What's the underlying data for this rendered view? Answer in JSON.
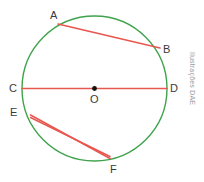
{
  "figure": {
    "width": 204,
    "height": 182,
    "background_color": "#ffffff",
    "credit_text": "Ilustrações DAE",
    "credit_color": "#9a9a9a"
  },
  "colors": {
    "circle_stroke": "#3FA34D",
    "chord_stroke": "#E8574F",
    "center_dot": "#111111",
    "label_text": "#3a3a3a"
  },
  "chart_data": {
    "type": "diagram",
    "circle": {
      "center": {
        "x": 94.5,
        "y": 88.5
      },
      "radius": 72.5,
      "stroke": "#3FA34D",
      "stroke_width": 1.4
    },
    "center_point": {
      "id": "O",
      "x": 94.5,
      "y": 88.5,
      "dot_radius": 2.4
    },
    "points": [
      {
        "id": "A",
        "x": 58.0,
        "y": 24.0,
        "label_x": 50,
        "label_y": 10
      },
      {
        "id": "B",
        "x": 160.0,
        "y": 48.0,
        "label_x": 163,
        "label_y": 44
      },
      {
        "id": "C",
        "x": 22.0,
        "y": 88.5,
        "label_x": 9,
        "label_y": 83
      },
      {
        "id": "D",
        "x": 167.0,
        "y": 88.5,
        "label_x": 170,
        "label_y": 83
      },
      {
        "id": "E",
        "x": 30.5,
        "y": 115.0,
        "label_x": 10,
        "label_y": 107
      },
      {
        "id": "F",
        "x": 110.0,
        "y": 158.5,
        "label_x": 110,
        "label_y": 164
      },
      {
        "id": "O",
        "x": 94.5,
        "y": 88.5,
        "label_x": 90,
        "label_y": 94
      }
    ],
    "chords": [
      {
        "name": "AB",
        "from": "A",
        "x1": 58.0,
        "y1": 24.0,
        "x2": 160.0,
        "y2": 48.0,
        "to": "B"
      },
      {
        "name": "CD",
        "from": "C",
        "x1": 22.0,
        "y1": 88.5,
        "x2": 167.0,
        "y2": 88.5,
        "to": "D"
      },
      {
        "name": "EF",
        "from": "E",
        "x1": 30.5,
        "y1": 115.0,
        "x2": 110.0,
        "y2": 158.5,
        "to": "F"
      },
      {
        "name": "EF2",
        "from": "E",
        "x1": 30.5,
        "y1": 117.5,
        "x2": 110.0,
        "y2": 156.5,
        "to": "F"
      }
    ],
    "labels": [
      "A",
      "B",
      "C",
      "D",
      "E",
      "F",
      "O"
    ]
  }
}
